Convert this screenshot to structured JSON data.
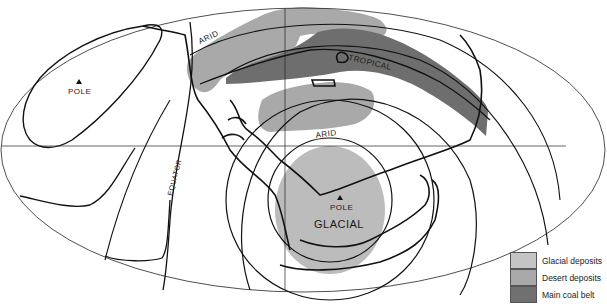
{
  "map": {
    "projection": "equal-area ellipse",
    "labels": {
      "pole_left": "POLE",
      "pole_center": "POLE",
      "arid_top": "ARID",
      "arid_center": "ARID",
      "tropical": "TROPICAL",
      "glacial": "GLACIAL",
      "equator": "EQUATOR"
    },
    "colors": {
      "glacial": "#bcbcbc",
      "desert": "#a9a9a9",
      "coal": "#6e6e6e",
      "line": "#111111"
    }
  },
  "legend": {
    "items": [
      {
        "label": "Glacial deposits",
        "color": "#c4c4c4"
      },
      {
        "label": "Desert deposits",
        "color": "#a8a8a8"
      },
      {
        "label": "Main coal belt",
        "color": "#707070"
      }
    ]
  }
}
